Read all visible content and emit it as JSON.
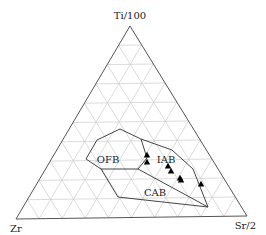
{
  "diagram": {
    "type": "ternary",
    "vertices": {
      "top": {
        "label": "Ti/100",
        "x": 130,
        "y": 26
      },
      "left": {
        "label": "Zr",
        "x": 16,
        "y": 219
      },
      "right": {
        "label": "Sr/2",
        "x": 247,
        "y": 216
      }
    },
    "grid_divisions": 10,
    "colors": {
      "frame": "#555555",
      "grid": "#d2d2d2",
      "field": "#444444",
      "marker": "#000000"
    },
    "fields": [
      {
        "label": "OFB",
        "x": 108,
        "y": 163
      },
      {
        "label": "IAB",
        "x": 166,
        "y": 163
      },
      {
        "label": "CAB",
        "x": 155,
        "y": 196
      }
    ],
    "boundaries": [
      {
        "name": "outer-top",
        "points": [
          [
            86,
            159
          ],
          [
            97,
            140
          ],
          [
            120,
            129
          ],
          [
            141,
            139
          ],
          [
            172,
            150
          ],
          [
            193,
            169
          ],
          [
            208,
            207
          ]
        ]
      },
      {
        "name": "outer-bottom-left",
        "points": [
          [
            86,
            159
          ],
          [
            101,
            169
          ],
          [
            118,
            197
          ],
          [
            208,
            207
          ]
        ]
      },
      {
        "name": "ofb-cab-divider",
        "points": [
          [
            101,
            169
          ],
          [
            138,
            169
          ],
          [
            208,
            207
          ]
        ]
      },
      {
        "name": "ofb-iab-divider",
        "points": [
          [
            141,
            139
          ],
          [
            147,
            158
          ],
          [
            138,
            169
          ]
        ]
      }
    ],
    "samples": [
      {
        "x": 147,
        "y": 155
      },
      {
        "x": 147,
        "y": 162
      },
      {
        "x": 168,
        "y": 166
      },
      {
        "x": 171,
        "y": 171
      },
      {
        "x": 180,
        "y": 178
      },
      {
        "x": 181,
        "y": 180
      },
      {
        "x": 201,
        "y": 184
      }
    ]
  }
}
